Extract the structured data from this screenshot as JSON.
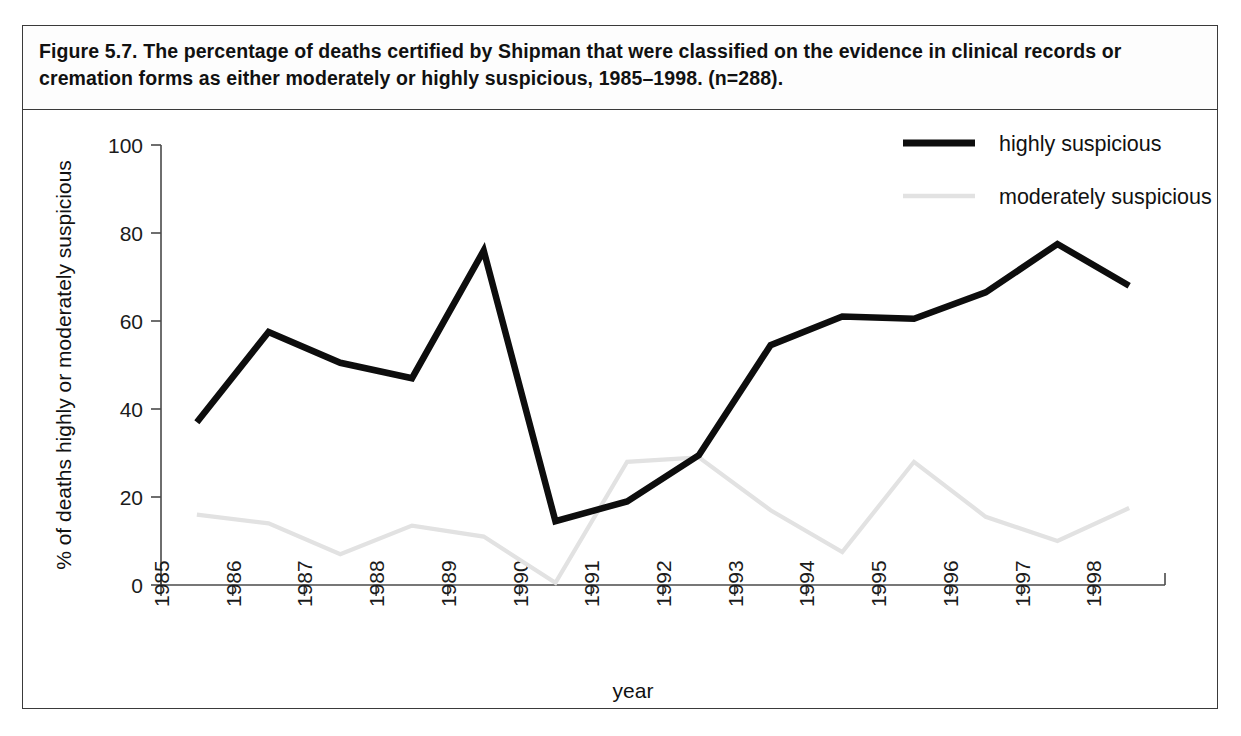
{
  "figure": {
    "caption": "Figure 5.7. The percentage of deaths certified by Shipman that were classified on the evidence in clinical records or cremation forms as either moderately or highly suspicious, 1985–1998. (n=288)."
  },
  "chart_data": {
    "type": "line",
    "title": "Figure 5.7. The percentage of deaths certified by Shipman that were classified on the evidence in clinical records or cremation forms as either moderately or highly suspicious, 1985–1998. (n=288).",
    "xlabel": "year",
    "ylabel": "% of deaths highly or moderately suspicious",
    "categories": [
      "1985",
      "1986",
      "1987",
      "1988",
      "1989",
      "1990",
      "1991",
      "1992",
      "1993",
      "1994",
      "1995",
      "1996",
      "1997",
      "1998"
    ],
    "x_tick_labels": [
      "1985",
      "1986",
      "1987",
      "1988",
      "1989",
      "1990",
      "1991",
      "1992",
      "1993",
      "1994",
      "1995",
      "1996",
      "1997",
      "1998"
    ],
    "y_tick_labels": [
      "0",
      "20",
      "40",
      "60",
      "80",
      "100"
    ],
    "y_ticks": [
      0,
      20,
      40,
      60,
      80,
      100
    ],
    "ylim": [
      0,
      100
    ],
    "xlim": [
      1985,
      1999
    ],
    "grid": false,
    "legend_position": "top-right",
    "series": [
      {
        "name": "highly suspicious",
        "color": "#0d0d0d",
        "values": [
          37,
          57.5,
          50.5,
          47,
          76,
          14.5,
          19,
          29.5,
          54.5,
          61,
          60.5,
          66.5,
          77.5,
          68
        ]
      },
      {
        "name": "moderately suspicious",
        "color": "#e2e2e2",
        "values": [
          16,
          14,
          7,
          13.5,
          11,
          0.5,
          28,
          29,
          17,
          7.5,
          28,
          15.5,
          10,
          17.5
        ]
      }
    ]
  },
  "legend": {
    "items": [
      {
        "label": "highly suspicious",
        "swatch": "thick-black-line-icon"
      },
      {
        "label": "moderately suspicious",
        "swatch": "thin-grey-line-icon"
      }
    ]
  }
}
